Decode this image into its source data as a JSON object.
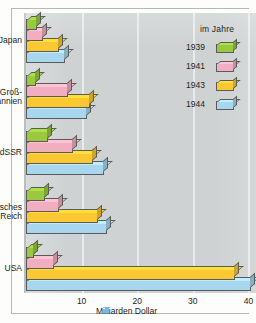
{
  "chart_data": {
    "type": "bar",
    "orientation": "horizontal",
    "title": "",
    "xlabel": "Milliarden Dollar",
    "ylabel": "",
    "xlim": [
      0,
      41
    ],
    "xticks": [
      10,
      20,
      30,
      40
    ],
    "xtick_labels": [
      "10",
      "20",
      "30",
      "40"
    ],
    "grid": true,
    "legend_position": "right",
    "legend_title": "im Jahre",
    "categories": [
      "Japan",
      "Groß-\nbritannien",
      "UdSSR",
      "Deutsches\nReich",
      "USA"
    ],
    "series": [
      {
        "name": "1939",
        "color": "#9ac93f",
        "values": [
          2.0,
          1.8,
          4.0,
          3.5,
          1.5
        ]
      },
      {
        "name": "1941",
        "color": "#f2aec1",
        "values": [
          3.0,
          7.5,
          8.5,
          6.0,
          5.0
        ]
      },
      {
        "name": "1943",
        "color": "#fbc833",
        "values": [
          6.0,
          11.5,
          12.0,
          13.0,
          37.5
        ]
      },
      {
        "name": "1944",
        "color": "#a8d6ef",
        "values": [
          7.0,
          11.0,
          14.0,
          14.5,
          40.5
        ]
      }
    ]
  },
  "legend": {
    "title": "im Jahre",
    "entries": [
      {
        "label": "1939",
        "color": "#9ac93f"
      },
      {
        "label": "1941",
        "color": "#f2aec1"
      },
      {
        "label": "1943",
        "color": "#fbc833"
      },
      {
        "label": "1944",
        "color": "#a8d6ef"
      }
    ]
  },
  "axis": {
    "x_label": "Milliarden Dollar",
    "ticks": [
      "10",
      "20",
      "30",
      "40"
    ]
  },
  "categories": [
    {
      "label": "Japan"
    },
    {
      "label": "Groß-\nbritannien"
    },
    {
      "label": "UdSSR"
    },
    {
      "label": "Deutsches\nReich"
    },
    {
      "label": "USA"
    }
  ],
  "colors": {
    "plot_background": "#cfd2d3",
    "page_background": "#fdfdfb",
    "gridline": "#eceef0",
    "axis": "#a9acad",
    "bar_outline": "#5a5a58",
    "text": "#231f20"
  }
}
